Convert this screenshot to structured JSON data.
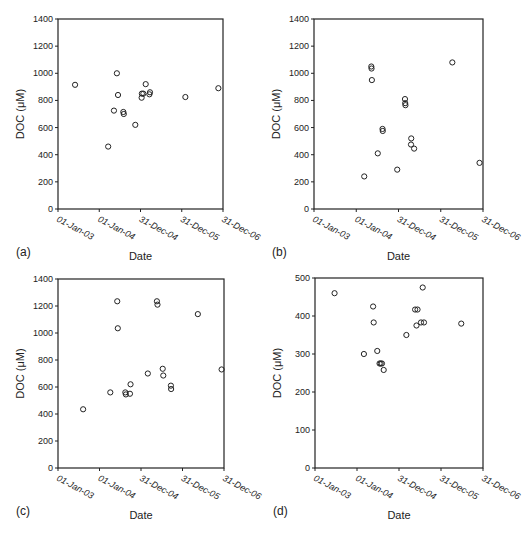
{
  "chart_data": [
    {
      "type": "scatter",
      "panel_label": "(a)",
      "xlabel": "Date",
      "ylabel": "DOC (μM)",
      "ylim": [
        0,
        1400
      ],
      "yticks": [
        0,
        200,
        400,
        600,
        800,
        1000,
        1200,
        1400
      ],
      "xticks": [
        "01-Jan-03",
        "01-Jan-04",
        "31-Dec-04",
        "31-Dec-05",
        "31-Dec-06"
      ],
      "xlim": [
        "2003-01-01",
        "2006-12-31"
      ],
      "grid": false,
      "legend": null,
      "points": [
        {
          "x": "2003-06-01",
          "y": 915
        },
        {
          "x": "2004-03-20",
          "y": 460
        },
        {
          "x": "2004-05-10",
          "y": 725
        },
        {
          "x": "2004-06-05",
          "y": 1000
        },
        {
          "x": "2004-06-15",
          "y": 840
        },
        {
          "x": "2004-08-01",
          "y": 715
        },
        {
          "x": "2004-08-05",
          "y": 700
        },
        {
          "x": "2004-11-15",
          "y": 620
        },
        {
          "x": "2005-01-10",
          "y": 820
        },
        {
          "x": "2005-01-12",
          "y": 850
        },
        {
          "x": "2005-01-25",
          "y": 850
        },
        {
          "x": "2005-02-15",
          "y": 920
        },
        {
          "x": "2005-03-20",
          "y": 845
        },
        {
          "x": "2005-03-25",
          "y": 860
        },
        {
          "x": "2006-02-01",
          "y": 825
        },
        {
          "x": "2006-11-20",
          "y": 890
        }
      ]
    },
    {
      "type": "scatter",
      "panel_label": "(b)",
      "xlabel": "Date",
      "ylabel": "DOC (μM)",
      "ylim": [
        0,
        1400
      ],
      "yticks": [
        0,
        200,
        400,
        600,
        800,
        1000,
        1200,
        1400
      ],
      "xticks": [
        "01-Jan-03",
        "01-Jan-04",
        "31-Dec-04",
        "31-Dec-05",
        "31-Dec-06"
      ],
      "xlim": [
        "2003-01-01",
        "2006-12-31"
      ],
      "grid": false,
      "legend": null,
      "points": [
        {
          "x": "2004-03-10",
          "y": 240
        },
        {
          "x": "2004-05-10",
          "y": 1050
        },
        {
          "x": "2004-05-12",
          "y": 1035
        },
        {
          "x": "2004-05-15",
          "y": 950
        },
        {
          "x": "2004-07-05",
          "y": 410
        },
        {
          "x": "2004-08-15",
          "y": 590
        },
        {
          "x": "2004-08-17",
          "y": 575
        },
        {
          "x": "2004-12-20",
          "y": 290
        },
        {
          "x": "2005-02-25",
          "y": 810
        },
        {
          "x": "2005-02-27",
          "y": 780
        },
        {
          "x": "2005-03-01",
          "y": 765
        },
        {
          "x": "2005-04-20",
          "y": 520
        },
        {
          "x": "2005-04-18",
          "y": 475
        },
        {
          "x": "2005-05-15",
          "y": 445
        },
        {
          "x": "2006-04-10",
          "y": 1080
        },
        {
          "x": "2006-12-01",
          "y": 340
        }
      ]
    },
    {
      "type": "scatter",
      "panel_label": "(c)",
      "xlabel": "Date",
      "ylabel": "DOC (μM)",
      "ylim": [
        0,
        1400
      ],
      "yticks": [
        0,
        200,
        400,
        600,
        800,
        1000,
        1200,
        1400
      ],
      "xticks": [
        "01-Jan-03",
        "01-Jan-04",
        "31-Dec-04",
        "31-Dec-05",
        "31-Dec-06"
      ],
      "xlim": [
        "2003-01-01",
        "2006-12-31"
      ],
      "grid": false,
      "legend": null,
      "points": [
        {
          "x": "2003-08-10",
          "y": 435
        },
        {
          "x": "2004-04-05",
          "y": 560
        },
        {
          "x": "2004-06-05",
          "y": 1235
        },
        {
          "x": "2004-06-10",
          "y": 1035
        },
        {
          "x": "2004-08-15",
          "y": 560
        },
        {
          "x": "2004-08-20",
          "y": 545
        },
        {
          "x": "2004-09-25",
          "y": 550
        },
        {
          "x": "2004-09-30",
          "y": 620
        },
        {
          "x": "2005-03-01",
          "y": 700
        },
        {
          "x": "2005-05-20",
          "y": 1235
        },
        {
          "x": "2005-05-25",
          "y": 1210
        },
        {
          "x": "2005-07-10",
          "y": 735
        },
        {
          "x": "2005-07-15",
          "y": 685
        },
        {
          "x": "2005-09-20",
          "y": 610
        },
        {
          "x": "2005-09-22",
          "y": 585
        },
        {
          "x": "2006-05-15",
          "y": 1140
        },
        {
          "x": "2006-12-10",
          "y": 730
        }
      ]
    },
    {
      "type": "scatter",
      "panel_label": "(d)",
      "xlabel": "Date",
      "ylabel": "DOC (μM)",
      "ylim": [
        0,
        500
      ],
      "yticks": [
        0,
        100,
        200,
        300,
        400,
        500
      ],
      "xticks": [
        "01-Jan-03",
        "01-Jan-04",
        "31-Dec-04",
        "31-Dec-05",
        "31-Dec-06"
      ],
      "xlim": [
        "2003-01-01",
        "2006-12-31"
      ],
      "grid": false,
      "legend": null,
      "points": [
        {
          "x": "2003-06-20",
          "y": 460
        },
        {
          "x": "2004-03-01",
          "y": 300
        },
        {
          "x": "2004-05-20",
          "y": 425
        },
        {
          "x": "2004-05-25",
          "y": 383
        },
        {
          "x": "2004-06-25",
          "y": 308
        },
        {
          "x": "2004-07-15",
          "y": 275
        },
        {
          "x": "2004-07-25",
          "y": 275
        },
        {
          "x": "2004-08-05",
          "y": 275
        },
        {
          "x": "2004-08-20",
          "y": 258
        },
        {
          "x": "2005-03-05",
          "y": 350
        },
        {
          "x": "2005-05-20",
          "y": 417
        },
        {
          "x": "2005-06-10",
          "y": 417
        },
        {
          "x": "2005-06-01",
          "y": 375
        },
        {
          "x": "2005-07-10",
          "y": 383
        },
        {
          "x": "2005-07-25",
          "y": 475
        },
        {
          "x": "2005-08-05",
          "y": 383
        },
        {
          "x": "2006-06-25",
          "y": 380
        }
      ]
    }
  ],
  "panels": [
    {
      "label": "(a)",
      "xlabel": "Date",
      "ylabel": "DOC (μM)"
    },
    {
      "label": "(b)",
      "xlabel": "Date",
      "ylabel": "DOC (μM)"
    },
    {
      "label": "(c)",
      "xlabel": "Date",
      "ylabel": "DOC (μM)"
    },
    {
      "label": "(d)",
      "xlabel": "Date",
      "ylabel": "DOC (μM)"
    }
  ]
}
